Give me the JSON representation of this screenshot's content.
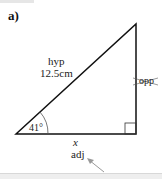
{
  "question_label": "a)",
  "triangle": {
    "hyp_label": "hyp",
    "hyp_value": "12.5cm",
    "angle": "41°",
    "opp_label": "opp",
    "adj_var": "x",
    "adj_label": "adj"
  }
}
